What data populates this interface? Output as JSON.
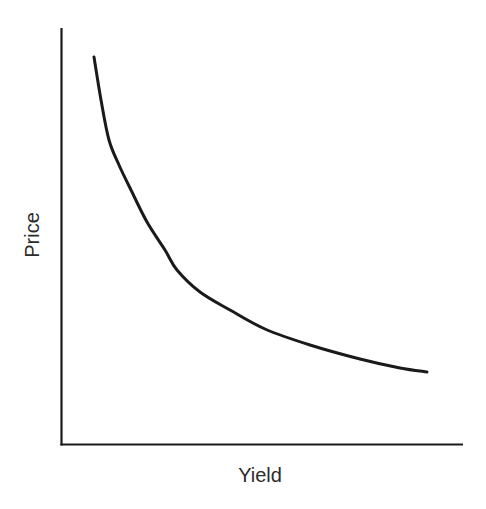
{
  "figure": {
    "background_color": "#ffffff",
    "line_color": "#1a1a1a",
    "text_color": "#2b2b2b",
    "caption_remnant": ""
  },
  "axis_labels": {
    "y": "Price",
    "x": "Yield"
  },
  "chart_data": {
    "type": "line",
    "title": "",
    "subtitle": "",
    "xlabel": "Yield",
    "ylabel": "Price",
    "xlim": [
      0,
      1
    ],
    "ylim": [
      0,
      1
    ],
    "grid": false,
    "legend": false,
    "legend_position": "none",
    "xticks": [],
    "yticks": [],
    "xticklabels": [],
    "yticklabels": [],
    "annotations": [],
    "series": [
      {
        "name": "Price-Yield Curve",
        "color": "#1a1a1a",
        "line_width": 3,
        "x": [
          0.082,
          0.1,
          0.12,
          0.145,
          0.174,
          0.208,
          0.259,
          0.289,
          0.42,
          0.619,
          0.911
        ],
        "y": [
          0.929,
          0.854,
          0.799,
          0.732,
          0.612,
          0.468,
          0.42,
          0.42,
          0.324,
          0.24,
          0.175
        ]
      }
    ],
    "pixel_geometry": {
      "y_axis": {
        "x": 61,
        "y_top": 28,
        "y_bottom": 445
      },
      "x_axis": {
        "y": 445,
        "x_left": 61,
        "x_right": 463
      },
      "curve_points": [
        [
          94,
          57
        ],
        [
          101,
          100
        ],
        [
          109,
          140
        ],
        [
          119,
          165
        ],
        [
          131,
          190
        ],
        [
          147,
          222
        ],
        [
          165,
          250
        ],
        [
          177,
          270
        ],
        [
          200,
          292
        ],
        [
          230,
          310
        ],
        [
          265,
          329
        ],
        [
          310,
          345
        ],
        [
          360,
          359
        ],
        [
          400,
          368
        ],
        [
          427,
          372
        ]
      ]
    }
  }
}
